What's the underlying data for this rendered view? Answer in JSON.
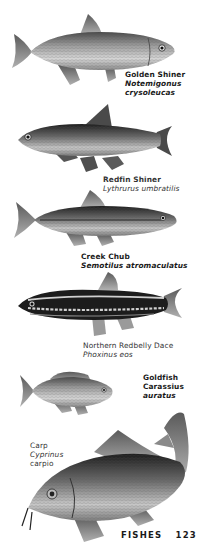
{
  "page": {
    "section": "FISHES",
    "page_number": "123"
  },
  "species": [
    {
      "common_name": "Golden Shiner",
      "scientific_name_line1": "Notemigonus",
      "scientific_name_line2": "crysoleucas",
      "illustration": "golden-shiner-illustration"
    },
    {
      "common_name": "Redfin Shiner",
      "scientific_name": "Lythrurus umbratilis",
      "illustration": "redfin-shiner-illustration"
    },
    {
      "common_name": "Creek Chub",
      "scientific_name": "Semotilus atromaculatus",
      "illustration": "creek-chub-illustration"
    },
    {
      "common_name": "Northern Redbelly Dace",
      "scientific_name": "Phoxinus eos",
      "illustration": "northern-redbelly-dace-illustration"
    },
    {
      "common_name": "Goldfish",
      "scientific_name_line1": "Carassius",
      "scientific_name_line2": "auratus",
      "illustration": "goldfish-illustration"
    },
    {
      "common_name": "Carp",
      "scientific_name_line1": "Cyprinus",
      "scientific_name_line2": "carpio",
      "illustration": "carp-illustration"
    }
  ],
  "colors": {
    "paper": "#ffffff",
    "ink": "#1a1a1a",
    "fish_dark": "#3a3a3a",
    "fish_mid": "#8a8a8a",
    "fish_light": "#d8d8d8"
  }
}
